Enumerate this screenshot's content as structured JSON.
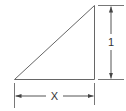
{
  "diagram": {
    "type": "dimensioned-right-triangle",
    "labels": {
      "height": "1",
      "base": "X"
    },
    "colors": {
      "stroke": "#555555",
      "text": "#333333",
      "background": "#ffffff"
    }
  }
}
